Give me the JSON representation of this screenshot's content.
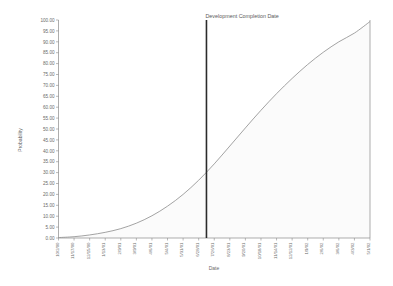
{
  "chart_data": {
    "type": "line",
    "title": "",
    "xlabel": "Date",
    "ylabel": "Probability",
    "ylim": [
      0,
      100
    ],
    "ytick_step": 5,
    "grid": false,
    "legend": null,
    "yticks": [
      "100.00",
      "95.00",
      "90.00",
      "85.00",
      "80.00",
      "75.00",
      "70.00",
      "65.00",
      "60.00",
      "55.00",
      "50.00",
      "45.00",
      "40.00",
      "35.00",
      "30.00",
      "25.00",
      "20.00",
      "15.00",
      "10.00",
      "5.00",
      "0.00"
    ],
    "categories": [
      "10/2/00",
      "11/17/00",
      "12/15/00",
      "1/13/01",
      "2/9/01",
      "3/9/01",
      "4/6/01",
      "5/4/01",
      "5/31/01",
      "6/28/01",
      "7/26/01",
      "8/23/01",
      "9/20/01",
      "10/18/01",
      "11/14/01",
      "12/12/01",
      "1/9/02",
      "2/6/02",
      "3/6/02",
      "4/3/02",
      "5/1/02"
    ],
    "series": [
      {
        "name": "Cumulative Probability",
        "values": [
          0.2,
          0.6,
          1.4,
          2.6,
          4.3,
          6.8,
          10.2,
          14.6,
          20.0,
          26.5,
          34.0,
          42.2,
          50.5,
          58.6,
          66.2,
          73.2,
          79.6,
          85.2,
          90.0,
          94.0,
          99.3
        ]
      }
    ],
    "annotations": [
      {
        "label": "Development Completion Date",
        "type": "vertical-line",
        "x_category": "7/26/01",
        "x_fraction": 0.475,
        "crosses_at_probability": 47.0
      }
    ]
  }
}
